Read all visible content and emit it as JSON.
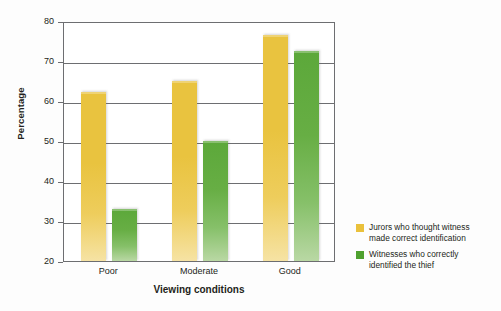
{
  "chart_data": {
    "type": "bar",
    "title": "",
    "xlabel": "Viewing conditions",
    "ylabel": "Percentage",
    "categories": [
      "Poor",
      "Moderate",
      "Good"
    ],
    "ylim": [
      20,
      80
    ],
    "yticks": [
      20,
      30,
      40,
      50,
      60,
      70,
      80
    ],
    "ytick_labels": [
      "20",
      "30",
      "40",
      "50",
      "60",
      "70",
      "80"
    ],
    "grid": true,
    "legend_position": "right",
    "series": [
      {
        "name": "Jurors who thought witness made correct identification",
        "color": "#e9c33f",
        "values": [
          62.3,
          65.0,
          76.5
        ]
      },
      {
        "name": "Witnesses who correctly identified the thief",
        "color": "#5ca83a",
        "values": [
          33.0,
          50.0,
          72.5
        ]
      }
    ]
  },
  "legend": {
    "entries": [
      {
        "label_line1": "Jurors who thought witness",
        "label_line2": "made correct identification",
        "swatch": "yellow-swatch-icon"
      },
      {
        "label_line1": "Witnesses who correctly",
        "label_line2": "identified the thief",
        "swatch": "green-swatch-icon"
      }
    ]
  }
}
